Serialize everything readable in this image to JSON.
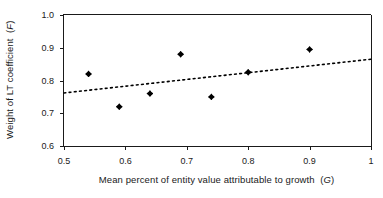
{
  "chart_data": {
    "type": "scatter",
    "title": "",
    "xlabel": "Mean percent of entity value attributable to growth (G)",
    "xlabel_plain": "Mean percent of entity value attributable to growth",
    "xlabel_symbol": "G",
    "ylabel": "Weight of LT coefficient (F)",
    "ylabel_plain": "Weight of LT coefficient",
    "ylabel_symbol": "F",
    "xlim": [
      0.5,
      1.0
    ],
    "ylim": [
      0.6,
      1.0
    ],
    "xticks": [
      0.5,
      0.6,
      0.7,
      0.8,
      0.9,
      1.0
    ],
    "xtick_labels": [
      "0.5",
      "0.6",
      "0.7",
      "0.8",
      "0.9",
      "1"
    ],
    "yticks": [
      0.6,
      0.7,
      0.8,
      0.9,
      1.0
    ],
    "ytick_labels": [
      "0.6",
      "0.7",
      "0.8",
      "0.9",
      "1.0"
    ],
    "grid": false,
    "legend": null,
    "marker": "diamond",
    "marker_color": "#000000",
    "x": [
      0.54,
      0.59,
      0.64,
      0.69,
      0.74,
      0.8,
      0.9
    ],
    "y": [
      0.82,
      0.72,
      0.76,
      0.88,
      0.75,
      0.825,
      0.895
    ],
    "points": [
      {
        "x": 0.54,
        "y": 0.82
      },
      {
        "x": 0.59,
        "y": 0.72
      },
      {
        "x": 0.64,
        "y": 0.76
      },
      {
        "x": 0.69,
        "y": 0.88
      },
      {
        "x": 0.74,
        "y": 0.75
      },
      {
        "x": 0.8,
        "y": 0.825
      },
      {
        "x": 0.9,
        "y": 0.895
      }
    ],
    "series": [
      {
        "name": "Entities",
        "type": "scatter",
        "x": [
          0.54,
          0.59,
          0.64,
          0.69,
          0.74,
          0.8,
          0.9
        ],
        "values": [
          0.82,
          0.72,
          0.76,
          0.88,
          0.75,
          0.825,
          0.895
        ]
      },
      {
        "name": "Trend line",
        "type": "line",
        "style": "dotted",
        "color": "#000000",
        "x": [
          0.5,
          1.0
        ],
        "values": [
          0.762,
          0.865
        ]
      }
    ],
    "trendline": {
      "style": "dotted",
      "color": "#000000",
      "x_start": 0.5,
      "y_start": 0.762,
      "x_end": 1.0,
      "y_end": 0.865
    },
    "axis_color": "#1a1a1a",
    "background": "#ffffff"
  }
}
